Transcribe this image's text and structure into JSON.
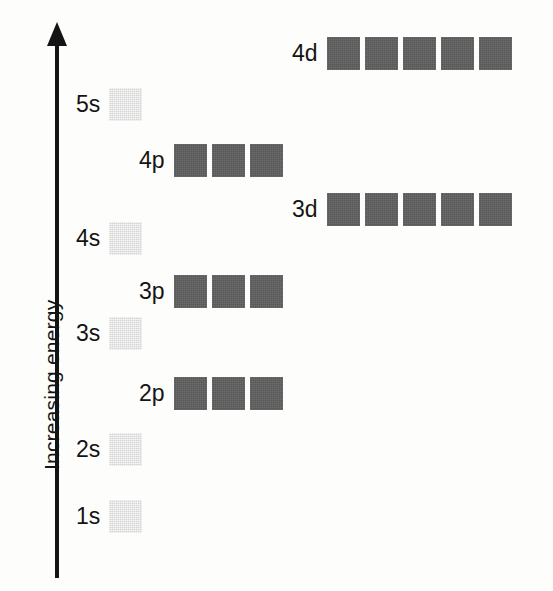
{
  "figure": {
    "background_color": "#fdfdfb",
    "axis": {
      "label": "Increasing energy",
      "direction": "up",
      "color": "#141414",
      "x": 58,
      "top": 24,
      "bottom": 578
    },
    "colors": {
      "s_orbital_box": "#d4d4d4",
      "p_orbital_box": "#5e5e5e",
      "d_orbital_box": "#5e5e5e",
      "text": "#141414"
    },
    "box_size": 33,
    "box_gap": 5
  },
  "chart_data": {
    "type": "diagram",
    "ylabel": "Increasing energy",
    "xlabel": "",
    "grid": false,
    "legend": null,
    "note": "Relative energies of atomic orbitals; each box is one orbital holding up to two electrons.",
    "orbitals": [
      {
        "label": "4d",
        "type": "d",
        "boxes": 5,
        "relative_energy_rank": 9
      },
      {
        "label": "5s",
        "type": "s",
        "boxes": 1,
        "relative_energy_rank": 8
      },
      {
        "label": "4p",
        "type": "p",
        "boxes": 3,
        "relative_energy_rank": 7
      },
      {
        "label": "3d",
        "type": "d",
        "boxes": 5,
        "relative_energy_rank": 6
      },
      {
        "label": "4s",
        "type": "s",
        "boxes": 1,
        "relative_energy_rank": 5
      },
      {
        "label": "3p",
        "type": "p",
        "boxes": 3,
        "relative_energy_rank": 4
      },
      {
        "label": "3s",
        "type": "s",
        "boxes": 1,
        "relative_energy_rank": 3
      },
      {
        "label": "2p",
        "type": "p",
        "boxes": 3,
        "relative_energy_rank": 2
      },
      {
        "label": "2s",
        "type": "s",
        "boxes": 1,
        "relative_energy_rank": 1
      },
      {
        "label": "1s",
        "type": "s",
        "boxes": 1,
        "relative_energy_rank": 0
      }
    ]
  },
  "rows": [
    {
      "label": "4d",
      "type": "d",
      "boxes": 5,
      "left": 292,
      "top": 37
    },
    {
      "label": "5s",
      "type": "s",
      "boxes": 1,
      "left": 76,
      "top": 88
    },
    {
      "label": "4p",
      "type": "p",
      "boxes": 3,
      "left": 139,
      "top": 144
    },
    {
      "label": "3d",
      "type": "d",
      "boxes": 5,
      "left": 292,
      "top": 193
    },
    {
      "label": "4s",
      "type": "s",
      "boxes": 1,
      "left": 76,
      "top": 222
    },
    {
      "label": "3p",
      "type": "p",
      "boxes": 3,
      "left": 139,
      "top": 275
    },
    {
      "label": "3s",
      "type": "s",
      "boxes": 1,
      "left": 76,
      "top": 317
    },
    {
      "label": "2p",
      "type": "p",
      "boxes": 3,
      "left": 139,
      "top": 377
    },
    {
      "label": "2s",
      "type": "s",
      "boxes": 1,
      "left": 76,
      "top": 433
    },
    {
      "label": "1s",
      "type": "s",
      "boxes": 1,
      "left": 76,
      "top": 500
    }
  ]
}
